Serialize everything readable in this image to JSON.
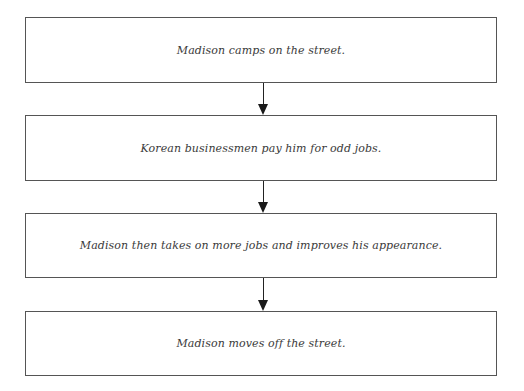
{
  "flowchart": {
    "steps": [
      {
        "label": "Madison camps on the street."
      },
      {
        "label": "Korean businessmen pay him for odd jobs."
      },
      {
        "label": "Madison then takes on more jobs and improves his appearance."
      },
      {
        "label": "Madison moves off the street."
      }
    ],
    "colors": {
      "border": "#555555",
      "text": "#3a3a3a",
      "arrow": "#1a1a1a",
      "background": "#ffffff"
    }
  }
}
